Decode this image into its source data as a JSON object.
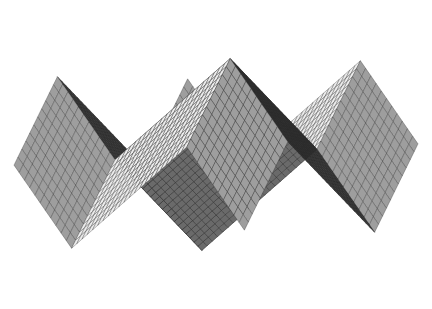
{
  "figure": {
    "title": "",
    "background_color": "#ffffff",
    "width": 432,
    "height": 309
  },
  "chart_data": {
    "type": "surface-mesh",
    "title": "",
    "subtitle": "",
    "xlabel": "",
    "ylabel": "",
    "zlabel": "",
    "grid": true,
    "legend": false,
    "axes_visible": false,
    "tick_labels": [],
    "annotations": [],
    "function": "z = triangle-wave peaks: z(x,y) = (1 - |x|) + (1 - |y|) style pyramidal tiling",
    "mesh": {
      "nx": 44,
      "ny": 44,
      "xlim": [
        -1,
        1
      ],
      "ylim": [
        -1,
        1
      ],
      "zlim": [
        -1,
        1
      ]
    },
    "projection": {
      "type": "axonometric",
      "azimuth_deg": -37,
      "elevation_deg": 22,
      "scale": 1.0
    },
    "features": [
      {
        "name": "peak-left-back",
        "kind": "peak",
        "screen_x": 178,
        "screen_y": 19,
        "shade": "dark"
      },
      {
        "name": "peak-right-back",
        "kind": "peak",
        "screen_x": 272,
        "screen_y": 23,
        "shade": "light"
      },
      {
        "name": "valley-left-front",
        "kind": "valley",
        "screen_x": 138,
        "screen_y": 293,
        "shade": "light"
      },
      {
        "name": "valley-right-front",
        "kind": "valley",
        "screen_x": 333,
        "screen_y": 268,
        "shade": "light"
      },
      {
        "name": "corner-left",
        "kind": "corner",
        "screen_x": 27,
        "screen_y": 170,
        "shade": "mid"
      },
      {
        "name": "corner-right",
        "kind": "corner",
        "screen_x": 415,
        "screen_y": 134,
        "shade": "mid"
      }
    ],
    "shading": {
      "model": "lambertian-facet",
      "light_azimuth_deg": 120,
      "light_elevation_deg": 55,
      "darkest": "#1a1a1a",
      "lightest": "#ffffff",
      "midtone": "#9a9a9a",
      "edge_color": "#2a2a2a",
      "edge_width": 0.45
    },
    "palette": {
      "background": "#ffffff",
      "mesh_line": "#303030",
      "facet_dark": "#232323",
      "facet_mid": "#a8a8a8",
      "facet_light": "#f2f2f2"
    }
  }
}
